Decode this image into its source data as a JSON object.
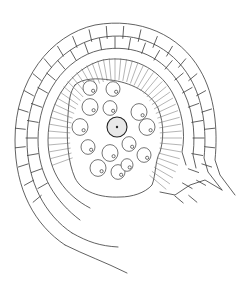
{
  "figure": {
    "outer_layer": {
      "description": "outer wall of rectangular cells, two rows",
      "rows": 2
    },
    "radial_layer": {
      "description": "band of elongated radially arranged cells"
    },
    "cavity": {
      "description": "central cavity containing round cells",
      "nucleus": {
        "cx": 117,
        "cy": 127,
        "r": 10,
        "fill": "#e8e8e8"
      },
      "cells": [
        {
          "cx": 90,
          "cy": 88,
          "r": 7
        },
        {
          "cx": 113,
          "cy": 89,
          "r": 7
        },
        {
          "cx": 90,
          "cy": 107,
          "r": 8
        },
        {
          "cx": 110,
          "cy": 108,
          "r": 7
        },
        {
          "cx": 139,
          "cy": 112,
          "r": 8
        },
        {
          "cx": 80,
          "cy": 127,
          "r": 8
        },
        {
          "cx": 147,
          "cy": 127,
          "r": 8
        },
        {
          "cx": 129,
          "cy": 144,
          "r": 7
        },
        {
          "cx": 88,
          "cy": 147,
          "r": 7
        },
        {
          "cx": 110,
          "cy": 153,
          "r": 8
        },
        {
          "cx": 144,
          "cy": 155,
          "r": 7
        },
        {
          "cx": 98,
          "cy": 168,
          "r": 8
        },
        {
          "cx": 118,
          "cy": 172,
          "r": 7
        },
        {
          "cx": 127,
          "cy": 165,
          "r": 6
        }
      ]
    },
    "colors": {
      "line": "#3a3a3a",
      "background": "#ffffff"
    }
  }
}
